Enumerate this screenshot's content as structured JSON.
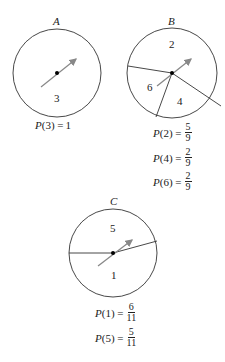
{
  "spinners": {
    "A": {
      "label": "A",
      "regions": [
        "3"
      ],
      "probabilities": [
        {
          "text": "P(3) = ",
          "num": "1",
          "den": ""
        }
      ]
    },
    "B": {
      "label": "B",
      "regions": [
        "2",
        "4",
        "6"
      ],
      "probabilities": [
        {
          "text": "P(2) = ",
          "num": "5",
          "den": "9"
        },
        {
          "text": "P(4) = ",
          "num": "2",
          "den": "9"
        },
        {
          "text": "P(6) = ",
          "num": "2",
          "den": "9"
        }
      ]
    },
    "C": {
      "label": "C",
      "regions": [
        "5",
        "1"
      ],
      "probabilities": [
        {
          "text": "P(1) = ",
          "num": "6",
          "den": "11"
        },
        {
          "text": "P(5) = ",
          "num": "5",
          "den": "11"
        }
      ]
    }
  },
  "colors": {
    "stroke": "#333333",
    "arrow": "#888888"
  }
}
